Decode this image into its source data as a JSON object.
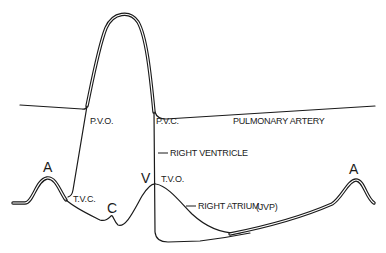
{
  "diagram": {
    "title": "",
    "labels": {
      "pvo": "P.V.O.",
      "pvc": "P.V.C.",
      "pulmonary_artery": "PULMONARY ARTERY",
      "right_ventricle": "RIGHT VENTRICLE",
      "tvo": "T.V.O.",
      "tvc": "T.V.C.",
      "right_atrium": "RIGHT ATRIUM",
      "jvp": "(JVP)",
      "wave_a_left": "A",
      "wave_c": "C",
      "wave_v": "V",
      "wave_a_right": "A"
    },
    "traces": [
      {
        "name": "pulmonary-artery",
        "style": "single"
      },
      {
        "name": "right-ventricle",
        "style": "double"
      },
      {
        "name": "right-atrium",
        "style": "single/double"
      }
    ],
    "colors": {
      "ink": "#1a1a1a",
      "background": "#ffffff"
    }
  }
}
